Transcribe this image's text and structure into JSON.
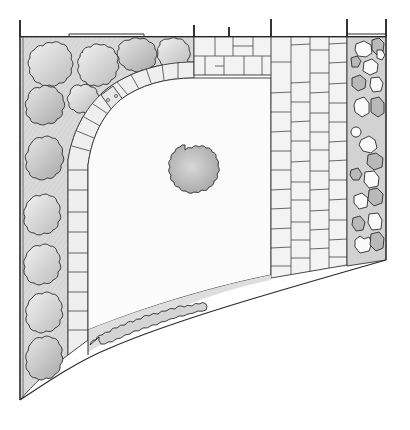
{
  "drawing": {
    "title": "Garden plan sketch",
    "style": "hand-drawn pencil landscape plan",
    "colors": {
      "ink": "#2a2a2a",
      "bed_fill": "#dcdcdc",
      "paving_fill": "#f3f3f3",
      "lawn_fill": "#fbfbfb",
      "shrub_light": "#e4e4e4",
      "shrub_mid": "#cfcfcf",
      "shrub_dark": "#b4b4b4",
      "background": "#ffffff"
    }
  },
  "elements": {
    "boundary_wall": {
      "label": "Boundary wall (top)",
      "posts": 6
    },
    "left_border_bed": {
      "label": "Left planting border",
      "shrubs": 11
    },
    "curved_paver_edging": {
      "label": "Curved paver edging",
      "pavers": 20,
      "stepping_stone_with_dots": 1
    },
    "lawn": {
      "label": "Lawn (quarter-circle)"
    },
    "feature_tree": {
      "label": "Central specimen shrub"
    },
    "paved_path_top": {
      "label": "Paved strip along top wall",
      "courses": 2
    },
    "paved_terrace_right": {
      "label": "Paved area",
      "columns": 4
    },
    "right_rock_bed": {
      "label": "Right rock / gravel bed",
      "stones": 22
    },
    "bottom_hedge_bed": {
      "label": "Low hedge strip along curved edge"
    },
    "curved_boundary": {
      "label": "Curved lower boundary"
    }
  }
}
